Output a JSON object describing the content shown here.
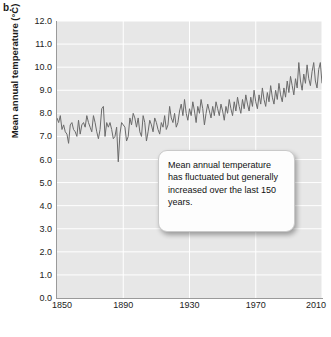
{
  "panel": {
    "label": "b."
  },
  "chart_data": {
    "type": "line",
    "title": "",
    "xlabel": "Year",
    "ylabel": "Mean annual temperature (°C)",
    "xlim": [
      1850,
      2010
    ],
    "ylim": [
      0.0,
      12.0
    ],
    "xticks": [
      "1850",
      "1890",
      "1930",
      "1970",
      "2010"
    ],
    "xtick_values": [
      1850,
      1890,
      1930,
      1970,
      2010
    ],
    "yticks": [
      "0.0",
      "1.0",
      "2.0",
      "3.0",
      "4.0",
      "5.0",
      "6.0",
      "7.0",
      "8.0",
      "9.0",
      "10.0",
      "11.0",
      "12.0"
    ],
    "ytick_values": [
      0,
      1,
      2,
      3,
      4,
      5,
      6,
      7,
      8,
      9,
      10,
      11,
      12
    ],
    "grid": true,
    "grid_color": "#ffffff",
    "plot_background": "#e7e7e7",
    "legend": null,
    "series": [
      {
        "name": "Mean annual temperature",
        "color": "#6b6b6b",
        "x_start": 1850,
        "x_step": 1,
        "values": [
          7.8,
          7.6,
          7.9,
          7.3,
          7.5,
          7.2,
          7.1,
          6.7,
          7.5,
          7.6,
          7.3,
          7.2,
          7.0,
          7.7,
          7.1,
          7.5,
          7.6,
          7.4,
          7.9,
          7.6,
          7.4,
          7.2,
          7.9,
          7.6,
          7.2,
          6.9,
          7.3,
          8.2,
          8.3,
          7.0,
          7.6,
          7.4,
          7.6,
          7.3,
          6.9,
          7.0,
          7.4,
          5.9,
          7.1,
          7.6,
          7.5,
          7.4,
          6.8,
          7.0,
          7.8,
          7.5,
          8.0,
          7.8,
          7.4,
          7.8,
          7.2,
          7.0,
          7.9,
          7.6,
          6.8,
          7.2,
          7.7,
          7.5,
          7.2,
          7.8,
          7.6,
          7.3,
          7.1,
          7.6,
          7.4,
          7.9,
          7.3,
          7.5,
          8.3,
          7.8,
          7.6,
          8.0,
          7.4,
          7.6,
          8.1,
          8.4,
          7.9,
          8.6,
          8.0,
          7.7,
          8.2,
          7.9,
          8.5,
          8.1,
          7.6,
          8.3,
          8.0,
          8.6,
          8.2,
          7.5,
          8.0,
          8.4,
          8.1,
          7.8,
          8.3,
          7.9,
          8.5,
          8.2,
          7.9,
          8.4,
          8.1,
          7.7,
          8.3,
          8.0,
          8.6,
          8.2,
          7.9,
          8.5,
          8.1,
          8.7,
          8.3,
          8.0,
          8.6,
          8.2,
          8.8,
          8.4,
          8.1,
          8.7,
          8.3,
          9.0,
          8.5,
          8.2,
          8.8,
          8.4,
          9.1,
          8.6,
          8.3,
          8.9,
          8.5,
          9.2,
          8.7,
          8.4,
          9.0,
          8.6,
          9.3,
          8.8,
          8.5,
          9.1,
          8.7,
          9.4,
          8.9,
          9.6,
          9.2,
          8.8,
          9.5,
          9.1,
          10.2,
          9.4,
          9.0,
          9.7,
          9.3,
          10.1,
          9.5,
          9.2,
          9.8,
          10.2,
          9.4,
          9.1,
          9.9,
          10.2,
          9.3
        ]
      }
    ],
    "annotations": [
      {
        "name": "trend-callout",
        "text": "Mean annual temperature has fluctuated but generally increased over the last 150 years."
      }
    ]
  }
}
